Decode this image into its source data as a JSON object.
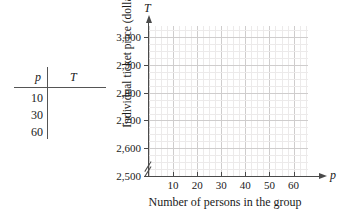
{
  "table": {
    "headers": [
      "p",
      "T"
    ],
    "rows": [
      {
        "p": "10",
        "T": ""
      },
      {
        "p": "30",
        "T": ""
      },
      {
        "p": "60",
        "T": ""
      }
    ]
  },
  "chart_data": {
    "type": "scatter",
    "title": "",
    "xlabel": "Number of persons in the group",
    "ylabel": "Individual ticket price (dollars)",
    "x_axis_variable": "p",
    "y_axis_variable": "T",
    "x_ticks": [
      "10",
      "20",
      "30",
      "40",
      "50",
      "60"
    ],
    "x_tick_values": [
      10,
      20,
      30,
      40,
      50,
      60
    ],
    "y_ticks": [
      "2,500",
      "2,600",
      "2,700",
      "2,800",
      "2,900",
      "3,000"
    ],
    "y_tick_values": [
      2500,
      2600,
      2700,
      2800,
      2900,
      3000
    ],
    "xlim": [
      0,
      66
    ],
    "ylim": [
      2500,
      3040
    ],
    "grid": true,
    "minor_grid": true,
    "y_axis_break": true,
    "series": [],
    "values": [],
    "legend": null
  },
  "colors": {
    "axis": "#4a4a4a",
    "grid_major": "#cfcdcd",
    "grid_minor": "#eceaea",
    "text": "#1a1a1a",
    "background": "#ffffff"
  }
}
